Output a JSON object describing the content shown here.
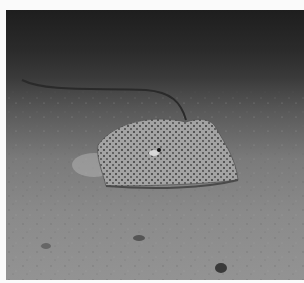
{
  "image": {
    "subject": "stingray on sandy seafloor",
    "alt": "A spotted stingray resting on a sandy ocean floor with its long tail curving behind it"
  },
  "colors": {
    "water_dark": "#1e1e1e",
    "sand": "#8a8a8a",
    "ray_body": "#9a9a9a",
    "ray_spots": "#3a3a3a"
  }
}
